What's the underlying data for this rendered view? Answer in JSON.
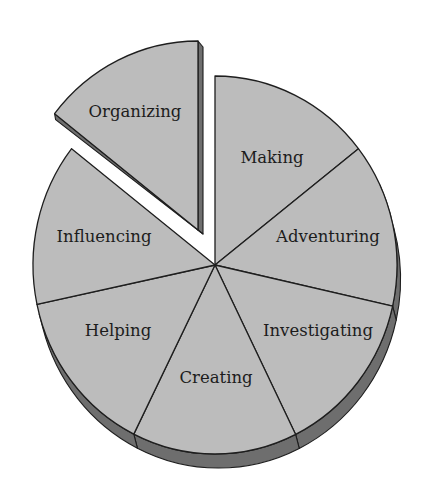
{
  "chart_data": {
    "type": "pie",
    "style": "3d-exploded",
    "title": "",
    "legend": "none",
    "categories": [
      "Making",
      "Adventuring",
      "Investigating",
      "Creating",
      "Helping",
      "Influencing",
      "Organizing"
    ],
    "values": [
      14.3,
      14.3,
      14.3,
      14.3,
      14.3,
      14.3,
      14.3
    ],
    "exploded": [
      "Organizing"
    ],
    "slices": [
      {
        "label": "Making",
        "start_deg": -90,
        "end_deg": -38,
        "label_pos": [
          272,
          158
        ]
      },
      {
        "label": "Adventuring",
        "start_deg": -38,
        "end_deg": 12.6,
        "label_pos": [
          328,
          237
        ]
      },
      {
        "label": "Investigating",
        "start_deg": 12.6,
        "end_deg": 63.7,
        "label_pos": [
          318,
          331
        ]
      },
      {
        "label": "Creating",
        "start_deg": 63.7,
        "end_deg": 116.5,
        "label_pos": [
          216,
          378
        ]
      },
      {
        "label": "Helping",
        "start_deg": 116.5,
        "end_deg": 168,
        "label_pos": [
          118,
          331
        ]
      },
      {
        "label": "Influencing",
        "start_deg": 168,
        "end_deg": 218,
        "label_pos": [
          104,
          237
        ]
      },
      {
        "label": "Organizing",
        "start_deg": 218,
        "end_deg": 270,
        "label_pos": [
          135,
          112
        ],
        "offset": [
          -17,
          -35
        ]
      }
    ],
    "colors": {
      "top_face": "#bcbcbc",
      "side_face": "#6e6e6e",
      "outline": "#1e1e1e",
      "text": "#1c1c1c"
    }
  }
}
